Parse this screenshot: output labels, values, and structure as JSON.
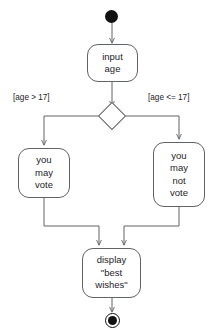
{
  "diagram": {
    "type": "uml-activity-diagram",
    "stroke_color": "#5f6366",
    "text_color": "#1d1d1f",
    "fill_color": "#ffffff",
    "background": "#ffffff",
    "nodes": {
      "start": {
        "kind": "initial-node",
        "label": ""
      },
      "input_age": {
        "kind": "action",
        "lines": [
          "input",
          "age"
        ]
      },
      "decision": {
        "kind": "decision-node",
        "label": ""
      },
      "may_vote": {
        "kind": "action",
        "lines": [
          "you",
          "may",
          "vote"
        ]
      },
      "may_not_vote": {
        "kind": "action",
        "lines": [
          "you",
          "may",
          "not",
          "vote"
        ]
      },
      "display_best_wishes": {
        "kind": "action",
        "lines": [
          "display",
          "\"best",
          "wishes\""
        ]
      },
      "final": {
        "kind": "final-node",
        "label": ""
      }
    },
    "guards": {
      "left": "[age > 17]",
      "right": "[age <= 17]"
    }
  }
}
